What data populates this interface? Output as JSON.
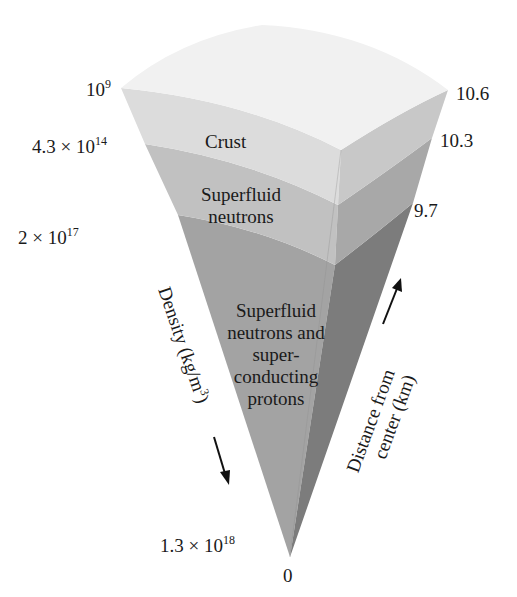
{
  "diagram": {
    "layers": [
      {
        "name": "Crust",
        "lines": [
          "Crust"
        ],
        "color": "#dcdcdc"
      },
      {
        "name": "Superfluid neutrons",
        "lines": [
          "Superfluid",
          "neutrons"
        ],
        "color": "#c4c4c4"
      },
      {
        "name": "Superfluid neutrons and superconducting protons",
        "lines": [
          "Superfluid",
          "neutrons and",
          "super-",
          "conducting",
          "protons"
        ],
        "color": "#a8a8a8"
      }
    ],
    "density_labels": [
      {
        "base": "10",
        "exp": "9"
      },
      {
        "base": "4.3 × 10",
        "exp": "14"
      },
      {
        "base": "2 × 10",
        "exp": "17"
      },
      {
        "base": "1.3 × 10",
        "exp": "18"
      }
    ],
    "distance_labels": [
      "10.6",
      "10.3",
      "9.7",
      "0"
    ],
    "axes": {
      "density_axis": {
        "label": "Density (kg/m",
        "exp": "3",
        "close": ")",
        "direction": "down-arrow"
      },
      "distance_axis": {
        "line1": "Distance from",
        "line2": "center (km)",
        "direction": "up-arrow"
      }
    },
    "colors": {
      "top_surface": "#f2f2f2",
      "crust_front": "#dedede",
      "crust_side": "#c9c9c9",
      "neutron_front": "#c2c2c2",
      "neutron_side": "#a9a9a9",
      "core_front": "#a5a5a5",
      "core_side": "#7d7d7d"
    }
  }
}
